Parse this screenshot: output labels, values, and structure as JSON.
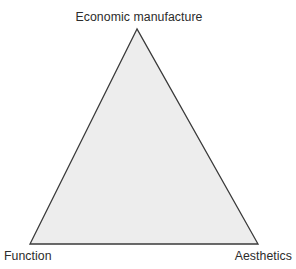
{
  "figure": {
    "type": "triangle-diagram",
    "background_color": "#ffffff",
    "canvas": {
      "width": 296,
      "height": 269
    }
  },
  "chart_data": {
    "type": "diagram",
    "shape": "triangle",
    "title": "",
    "vertices": [
      {
        "id": "apex",
        "label": "Economic manufacture",
        "x": 137,
        "y": 29,
        "position": "top"
      },
      {
        "id": "bottom-left",
        "label": "Function",
        "x": 30,
        "y": 244,
        "position": "bottom-left"
      },
      {
        "id": "bottom-right",
        "label": "Aesthetics",
        "x": 258,
        "y": 244,
        "position": "bottom-right"
      }
    ],
    "fill_color": "#ededed",
    "stroke_color": "#3a3a3a",
    "stroke_width": 1.3,
    "legend": [],
    "annotations": []
  },
  "labels": {
    "apex": "Economic manufacture",
    "bottom_left": "Function",
    "bottom_right": "Aesthetics"
  },
  "colors": {
    "fill": "#ededed",
    "stroke": "#3a3a3a",
    "text": "#2c2c2c",
    "background": "#ffffff"
  }
}
